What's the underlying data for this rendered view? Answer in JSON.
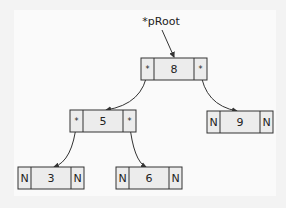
{
  "root_pointer": {
    "label": "*pRoot"
  },
  "pointer_symbol": "*",
  "null_symbol": "N",
  "nodes": [
    {
      "id": "n8",
      "value": "8",
      "left": "*",
      "right": "*"
    },
    {
      "id": "n5",
      "value": "5",
      "left": "*",
      "right": "*"
    },
    {
      "id": "n9",
      "value": "9",
      "left": "N",
      "right": "N"
    },
    {
      "id": "n3",
      "value": "3",
      "left": "N",
      "right": "N"
    },
    {
      "id": "n6",
      "value": "6",
      "left": "N",
      "right": "N"
    }
  ],
  "edges": [
    {
      "from": "n8",
      "side": "left",
      "to": "n5"
    },
    {
      "from": "n8",
      "side": "right",
      "to": "n9"
    },
    {
      "from": "n5",
      "side": "left",
      "to": "n3"
    },
    {
      "from": "n5",
      "side": "right",
      "to": "n6"
    }
  ],
  "colors": {
    "cell_fill": "#ececec",
    "stroke": "#333333",
    "background": "#fafafa"
  }
}
